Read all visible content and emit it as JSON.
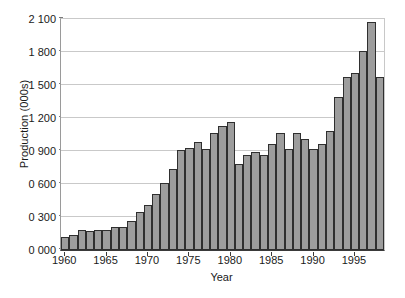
{
  "chart_data": {
    "type": "bar",
    "title": "",
    "xlabel": "Year",
    "ylabel": "Production (000s)",
    "ylim": [
      0,
      2100
    ],
    "ytick_labels": [
      "0 000",
      "0 300",
      "0 600",
      "0 900",
      "1 200",
      "1 500",
      "1 800",
      "2 100"
    ],
    "ytick_values": [
      0,
      300,
      600,
      900,
      1200,
      1500,
      1800,
      2100
    ],
    "xtick_labels": [
      "1960",
      "1965",
      "1970",
      "1975",
      "1980",
      "1985",
      "1990",
      "1995"
    ],
    "xtick_values": [
      1960,
      1965,
      1970,
      1975,
      1980,
      1985,
      1990,
      1995
    ],
    "grid": "horizontal",
    "legend": "none",
    "bar_color": "#9d9d9d",
    "bar_border_color": "#2f2f2f",
    "categories": [
      "1960",
      "1961",
      "1962",
      "1963",
      "1964",
      "1965",
      "1966",
      "1967",
      "1968",
      "1969",
      "1970",
      "1971",
      "1972",
      "1973",
      "1974",
      "1975",
      "1976",
      "1977",
      "1978",
      "1979",
      "1980",
      "1981",
      "1982",
      "1983",
      "1984",
      "1985",
      "1986",
      "1987",
      "1988",
      "1989",
      "1990",
      "1991",
      "1992",
      "1993",
      "1994",
      "1995",
      "1996",
      "1997",
      "1998"
    ],
    "values": [
      120,
      140,
      185,
      170,
      178,
      180,
      210,
      212,
      262,
      345,
      410,
      510,
      612,
      740,
      905,
      930,
      985,
      915,
      1065,
      1125,
      1160,
      780,
      860,
      890,
      860,
      965,
      1060,
      915,
      1065,
      1010,
      915,
      960,
      1080,
      1390,
      1570,
      1610,
      1805,
      2070,
      1570
    ]
  }
}
